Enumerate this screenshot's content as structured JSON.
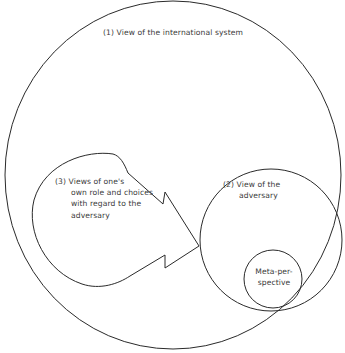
{
  "diagram": {
    "type": "nested-perception-diagram",
    "stroke_color": "#2a2a2a",
    "text_color": "#3a3a3a",
    "background": "#ffffff",
    "nodes": {
      "international_system": {
        "number": "(1)",
        "label": "View of the international system",
        "shape": "circle"
      },
      "own_role": {
        "number": "(3)",
        "lines": [
          "Views of one's",
          "own role and choices",
          "with regard to the",
          "adversary"
        ],
        "shape": "teardrop-arrow"
      },
      "adversary": {
        "number": "(2)",
        "lines": [
          "View of the",
          "adversary"
        ],
        "shape": "circle"
      },
      "meta_perspective": {
        "lines": [
          "Meta-per-",
          "spective"
        ],
        "shape": "circle"
      }
    },
    "edges": [
      {
        "from": "own_role",
        "to": "adversary",
        "style": "arrow"
      }
    ]
  }
}
